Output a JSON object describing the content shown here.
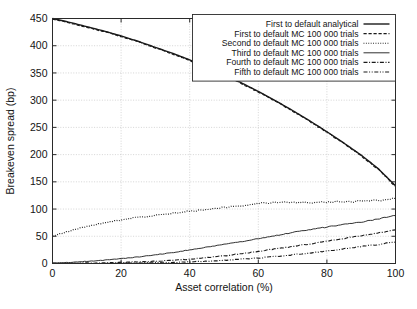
{
  "chart_data": {
    "type": "line",
    "title": "",
    "xlabel": "Asset correlation (%)",
    "ylabel": "Breakeven spread (bp)",
    "xlim": [
      0,
      100
    ],
    "ylim": [
      0,
      450
    ],
    "xticks": [
      0,
      20,
      40,
      60,
      80,
      100
    ],
    "yticks": [
      0,
      50,
      100,
      150,
      200,
      250,
      300,
      350,
      400,
      450
    ],
    "grid": true,
    "legend_position": "top-right",
    "series": [
      {
        "name": "First to default analytical",
        "style": "solid",
        "width": 1.4,
        "x": [
          0,
          5,
          10,
          15,
          20,
          25,
          30,
          35,
          40,
          45,
          50,
          55,
          60,
          65,
          70,
          75,
          80,
          85,
          90,
          95,
          100
        ],
        "values": [
          450,
          443,
          435,
          427,
          418,
          408,
          397,
          386,
          374,
          361,
          347,
          332,
          316,
          299,
          281,
          262,
          242,
          221,
          199,
          174,
          143
        ]
      },
      {
        "name": "First to default MC 100 000 trials",
        "style": "dashed",
        "width": 1.2,
        "x": [
          0,
          5,
          10,
          15,
          20,
          25,
          30,
          35,
          40,
          45,
          50,
          55,
          60,
          65,
          70,
          75,
          80,
          85,
          90,
          95,
          100
        ],
        "values": [
          449,
          442,
          434,
          426,
          417,
          407,
          396,
          385,
          373,
          360,
          346,
          331,
          315,
          298,
          280,
          261,
          241,
          220,
          198,
          173,
          142
        ]
      },
      {
        "name": "Second to default MC 100 000 trials",
        "style": "dotted",
        "width": 1.2,
        "x": [
          0,
          4,
          8,
          12,
          16,
          20,
          24,
          28,
          32,
          36,
          40,
          44,
          48,
          52,
          56,
          60,
          64,
          68,
          72,
          76,
          80,
          84,
          88,
          92,
          96,
          100
        ],
        "values": [
          50,
          58,
          65,
          71,
          76,
          80,
          84,
          87,
          90,
          93,
          96,
          99,
          102,
          104,
          107,
          110,
          112,
          113,
          112,
          112,
          113,
          114,
          114,
          115,
          117,
          120
        ]
      },
      {
        "name": "Third to default MC 100 000 trials",
        "style": "solid-thin",
        "width": 0.9,
        "x": [
          0,
          5,
          10,
          15,
          20,
          25,
          30,
          35,
          40,
          45,
          50,
          55,
          60,
          65,
          70,
          75,
          80,
          85,
          90,
          95,
          100
        ],
        "values": [
          1,
          2,
          4,
          6,
          9,
          12,
          16,
          20,
          25,
          30,
          35,
          40,
          46,
          51,
          57,
          62,
          67,
          72,
          76,
          82,
          88
        ]
      },
      {
        "name": "Fourth to default MC 100 000 trials",
        "style": "dash-dot",
        "width": 1.1,
        "x": [
          0,
          5,
          10,
          15,
          20,
          25,
          30,
          35,
          40,
          45,
          50,
          55,
          60,
          65,
          70,
          75,
          80,
          85,
          90,
          95,
          100
        ],
        "values": [
          0,
          0,
          1,
          1,
          2,
          3,
          4,
          6,
          8,
          11,
          14,
          18,
          22,
          27,
          31,
          36,
          41,
          46,
          51,
          56,
          62
        ]
      },
      {
        "name": "Fifth to default MC 100 000 trials",
        "style": "dash-dot-dot",
        "width": 1.1,
        "x": [
          0,
          5,
          10,
          15,
          20,
          25,
          30,
          35,
          40,
          45,
          50,
          55,
          60,
          65,
          70,
          75,
          80,
          85,
          90,
          95,
          100
        ],
        "values": [
          0,
          0,
          0,
          0,
          1,
          1,
          2,
          2,
          3,
          4,
          6,
          8,
          10,
          13,
          16,
          19,
          23,
          27,
          31,
          35,
          40
        ]
      }
    ]
  },
  "legend": {
    "entries": [
      {
        "label": "First to default analytical",
        "style": "solid"
      },
      {
        "label": "First to default MC 100 000 trials",
        "style": "dashed"
      },
      {
        "label": "Second to default MC 100 000 trials",
        "style": "dotted"
      },
      {
        "label": "Third to default MC 100 000 trials",
        "style": "solid-thin"
      },
      {
        "label": "Fourth to default MC 100 000 trials",
        "style": "dash-dot"
      },
      {
        "label": "Fifth to default MC 100 000 trials",
        "style": "dash-dot-dot"
      }
    ]
  },
  "colors": {
    "line": "#1a1a1a",
    "grid": "#b9b9b9",
    "axis": "#2a2a2a",
    "background": "#ffffff",
    "text": "#141414"
  }
}
